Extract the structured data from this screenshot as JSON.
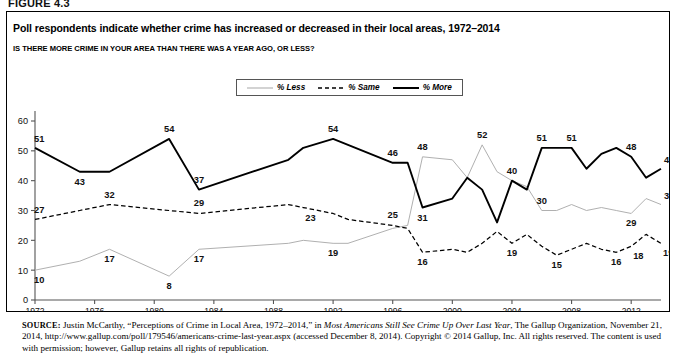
{
  "figure": {
    "label": "FIGURE 4.3",
    "title": "Poll respondents indicate whether crime has increased or decreased in their local areas, 1972–2014",
    "subtitle": "IS THERE MORE CRIME IN YOUR AREA THAN THERE WAS A YEAR AGO, OR LESS?"
  },
  "source": {
    "prefix": "SOURCE:",
    "part1": " Justin McCarthy, “Perceptions of Crime in Local Area, 1972–2014,” in ",
    "italic1": "Most Americans Still See Crime Up Over Last Year",
    "part2": ", The Gallup Organization, November 21, 2014, http://www.gallup.com/poll/179546/americans-crime-last-year.aspx (accessed December 8, 2014). Copyright © 2014 Gallup, Inc. All rights reserved. The content is used with permission; however, Gallup retains all rights of republication."
  },
  "legend": {
    "position": "top-center",
    "items": [
      {
        "label": "% Less",
        "color": "#b0b0b0",
        "style": "solid",
        "width": 1.0
      },
      {
        "label": "% Same",
        "color": "#000000",
        "style": "dashed",
        "width": 1.2
      },
      {
        "label": "% More",
        "color": "#000000",
        "style": "solid",
        "width": 1.9
      }
    ]
  },
  "chart_data": {
    "type": "line",
    "title": "Poll respondents indicate whether crime has increased or decreased in their local areas, 1972–2014",
    "subtitle": "IS THERE MORE CRIME IN YOUR AREA THAN THERE WAS A YEAR AGO, OR LESS?",
    "xlabel": "",
    "ylabel": "",
    "xlim": [
      1972,
      2014
    ],
    "ylim": [
      0,
      60
    ],
    "yticks": [
      0,
      10,
      20,
      30,
      40,
      50,
      60
    ],
    "xticks": [
      1972,
      1976,
      1980,
      1984,
      1988,
      1992,
      1996,
      2000,
      2004,
      2008,
      2012
    ],
    "grid": false,
    "x": [
      1972,
      1975,
      1977,
      1981,
      1983,
      1989,
      1990,
      1992,
      1993,
      1996,
      1997,
      1998,
      2000,
      2001,
      2002,
      2003,
      2004,
      2005,
      2006,
      2007,
      2008,
      2009,
      2010,
      2011,
      2012,
      2013,
      2014
    ],
    "series": [
      {
        "name": "% More",
        "color": "#000000",
        "style": "solid",
        "values": [
          51,
          43,
          43,
          54,
          37,
          47,
          51,
          54,
          52,
          46,
          46,
          31,
          34,
          41,
          37,
          26,
          40,
          37,
          51,
          51,
          51,
          44,
          49,
          51,
          48,
          41,
          44
        ],
        "labels": [
          {
            "x": 1972,
            "y": 51,
            "text": "51",
            "pos": "above-left"
          },
          {
            "x": 1975,
            "y": 43,
            "text": "43",
            "pos": "below"
          },
          {
            "x": 1981,
            "y": 54,
            "text": "54",
            "pos": "above"
          },
          {
            "x": 1983,
            "y": 37,
            "text": "37",
            "pos": "above"
          },
          {
            "x": 1992,
            "y": 54,
            "text": "54",
            "pos": "above"
          },
          {
            "x": 1996,
            "y": 46,
            "text": "46",
            "pos": "above"
          },
          {
            "x": 1998,
            "y": 31,
            "text": "31",
            "pos": "below"
          },
          {
            "x": 2004,
            "y": 40,
            "text": "40",
            "pos": "above"
          },
          {
            "x": 2006,
            "y": 51,
            "text": "51",
            "pos": "above"
          },
          {
            "x": 2008,
            "y": 51,
            "text": "51",
            "pos": "above"
          },
          {
            "x": 2012,
            "y": 48,
            "text": "48",
            "pos": "above"
          },
          {
            "x": 2014,
            "y": 44,
            "text": "44",
            "pos": "above-right"
          }
        ]
      },
      {
        "name": "% Same",
        "color": "#000000",
        "style": "dashed",
        "values": [
          27,
          30,
          32,
          30,
          29,
          32,
          31,
          29,
          27,
          25,
          24,
          16,
          17,
          16,
          19,
          23,
          19,
          22,
          18,
          15,
          17,
          19,
          17,
          16,
          18,
          22,
          19
        ],
        "labels": [
          {
            "x": 1972,
            "y": 27,
            "text": "27",
            "pos": "above-left"
          },
          {
            "x": 1977,
            "y": 32,
            "text": "32",
            "pos": "above"
          },
          {
            "x": 1983,
            "y": 29,
            "text": "29",
            "pos": "above"
          },
          {
            "x": 1990,
            "y": 31,
            "text": "23",
            "pos": "below-right"
          },
          {
            "x": 1996,
            "y": 25,
            "text": "25",
            "pos": "above"
          },
          {
            "x": 1998,
            "y": 16,
            "text": "16",
            "pos": "below"
          },
          {
            "x": 2004,
            "y": 19,
            "text": "19",
            "pos": "below"
          },
          {
            "x": 2007,
            "y": 15,
            "text": "15",
            "pos": "below"
          },
          {
            "x": 2011,
            "y": 16,
            "text": "16",
            "pos": "below"
          },
          {
            "x": 2012,
            "y": 18,
            "text": "18",
            "pos": "below-right"
          },
          {
            "x": 2014,
            "y": 19,
            "text": "19",
            "pos": "below-right"
          }
        ]
      },
      {
        "name": "% Less",
        "color": "#b0b0b0",
        "style": "solid",
        "values": [
          10,
          13,
          17,
          8,
          17,
          19,
          20,
          19,
          19,
          24,
          25,
          48,
          47,
          41,
          52,
          43,
          40,
          38,
          30,
          30,
          32,
          30,
          31,
          30,
          29,
          34,
          32
        ],
        "labels": [
          {
            "x": 1972,
            "y": 10,
            "text": "10",
            "pos": "below-left"
          },
          {
            "x": 1977,
            "y": 17,
            "text": "17",
            "pos": "below"
          },
          {
            "x": 1981,
            "y": 8,
            "text": "8",
            "pos": "below"
          },
          {
            "x": 1983,
            "y": 17,
            "text": "17",
            "pos": "below"
          },
          {
            "x": 1992,
            "y": 19,
            "text": "19",
            "pos": "below"
          },
          {
            "x": 1998,
            "y": 48,
            "text": "48",
            "pos": "above"
          },
          {
            "x": 2002,
            "y": 52,
            "text": "52",
            "pos": "above"
          },
          {
            "x": 2006,
            "y": 30,
            "text": "30",
            "pos": "above"
          },
          {
            "x": 2012,
            "y": 29,
            "text": "29",
            "pos": "below"
          },
          {
            "x": 2014,
            "y": 32,
            "text": "32",
            "pos": "above-right"
          }
        ]
      }
    ]
  }
}
